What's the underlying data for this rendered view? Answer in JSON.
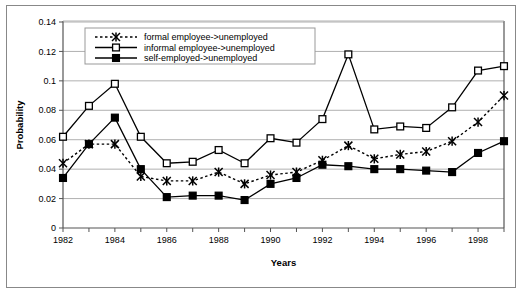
{
  "chart_data": {
    "type": "line",
    "title": "",
    "xlabel": "Years",
    "ylabel": "Probability",
    "ylim": [
      0,
      0.14
    ],
    "ytick_labels": [
      "0",
      "0.02",
      "0.04",
      "0.06",
      "0.08",
      "0.1",
      "0.12",
      "0.14"
    ],
    "ytick_values": [
      0,
      0.02,
      0.04,
      0.06,
      0.08,
      0.1,
      0.12,
      0.14
    ],
    "grid": true,
    "legend_position": "top-center",
    "x": [
      1982,
      1983,
      1984,
      1985,
      1986,
      1987,
      1988,
      1989,
      1990,
      1991,
      1992,
      1993,
      1994,
      1995,
      1996,
      1997,
      1998,
      1999
    ],
    "xtick_labels": [
      "1982",
      "",
      "1984",
      "",
      "1986",
      "",
      "1988",
      "",
      "1990",
      "",
      "1992",
      "",
      "1994",
      "",
      "1996",
      "",
      "1998",
      ""
    ],
    "series": [
      {
        "name": "formal employee->unemployed",
        "marker": "star-x",
        "line_style": "dotted",
        "color": "#000000",
        "values": [
          0.044,
          0.057,
          0.057,
          0.035,
          0.032,
          0.032,
          0.038,
          0.03,
          0.036,
          0.038,
          0.046,
          0.056,
          0.047,
          0.05,
          0.052,
          0.059,
          0.072,
          0.09
        ]
      },
      {
        "name": "informal employee->unemployed",
        "marker": "open-square",
        "line_style": "solid",
        "color": "#000000",
        "values": [
          0.062,
          0.083,
          0.098,
          0.062,
          0.044,
          0.045,
          0.053,
          0.044,
          0.061,
          0.058,
          0.074,
          0.118,
          0.067,
          0.069,
          0.068,
          0.082,
          0.107,
          0.11
        ]
      },
      {
        "name": "self-employed->unemployed",
        "marker": "filled-square",
        "line_style": "solid",
        "color": "#000000",
        "values": [
          0.034,
          0.057,
          0.075,
          0.04,
          0.021,
          0.022,
          0.022,
          0.019,
          0.03,
          0.034,
          0.043,
          0.042,
          0.04,
          0.04,
          0.039,
          0.038,
          0.051,
          0.059
        ]
      }
    ]
  },
  "legend": {
    "items": [
      {
        "label": "formal employee->unemployed"
      },
      {
        "label": "informal employee->unemployed"
      },
      {
        "label": "self-employed->unemployed"
      }
    ]
  }
}
